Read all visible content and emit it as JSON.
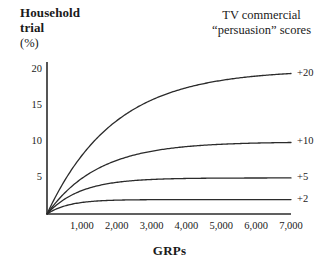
{
  "chart_data": {
    "type": "line",
    "title": "TV commercial “persuasion” scores",
    "title_line1": "TV commercial",
    "title_line2": "“persuasion” scores",
    "xlabel": "GRPs",
    "ylabel": "Household trial (%)",
    "ylabel_line1": "Household",
    "ylabel_line2": "trial",
    "ylabel_unit": "(%)",
    "xlim": [
      0,
      7000
    ],
    "ylim": [
      0,
      21
    ],
    "grid": false,
    "legend_position": "right-of-curve-ends",
    "xticks": [
      1000,
      2000,
      3000,
      4000,
      5000,
      6000,
      7000
    ],
    "xticklabels": [
      "1,000",
      "2,000",
      "3,000",
      "4,000",
      "5,000",
      "6,000",
      "7,000"
    ],
    "yticks": [
      5,
      10,
      15,
      20
    ],
    "yticklabels": [
      "5",
      "10",
      "15",
      "20"
    ],
    "line_color": "#2b2b2b",
    "axis_color": "#2b2b2b",
    "series": [
      {
        "name": "+20",
        "label": "+20",
        "asymptote": 20,
        "decay_k": 0.00052,
        "x": [
          0,
          250,
          500,
          750,
          1000,
          1500,
          2000,
          2500,
          3000,
          3500,
          4000,
          4500,
          5000,
          5500,
          6000,
          6500,
          7000
        ],
        "values": [
          0.0,
          2.4,
          4.6,
          6.5,
          8.1,
          10.8,
          12.9,
          14.5,
          15.8,
          16.8,
          17.5,
          18.1,
          18.5,
          18.9,
          19.1,
          19.3,
          19.5
        ]
      },
      {
        "name": "+10",
        "label": "+10",
        "asymptote": 10,
        "decay_k": 0.00068,
        "x": [
          0,
          250,
          500,
          750,
          1000,
          1500,
          2000,
          2500,
          3000,
          3500,
          4000,
          4500,
          5000,
          5500,
          6000,
          6500,
          7000
        ],
        "values": [
          0.0,
          1.5,
          2.9,
          4.0,
          4.9,
          6.4,
          7.4,
          8.2,
          8.7,
          9.1,
          9.3,
          9.5,
          9.7,
          9.8,
          9.8,
          9.9,
          9.9
        ]
      },
      {
        "name": "+5",
        "label": "+5",
        "asymptote": 5,
        "decay_k": 0.00105,
        "x": [
          0,
          250,
          500,
          750,
          1000,
          1500,
          2000,
          2500,
          3000,
          3500,
          4000,
          4500,
          5000,
          5500,
          6000,
          6500,
          7000
        ],
        "values": [
          0.0,
          1.15,
          2.05,
          2.72,
          3.25,
          3.96,
          4.39,
          4.64,
          4.79,
          4.87,
          4.93,
          4.96,
          4.97,
          4.98,
          4.99,
          4.99,
          5.0
        ]
      },
      {
        "name": "+2",
        "label": "+2",
        "asymptote": 2,
        "decay_k": 0.0016,
        "x": [
          0,
          250,
          500,
          750,
          1000,
          1500,
          2000,
          2500,
          3000,
          3500,
          4000,
          4500,
          5000,
          5500,
          6000,
          6500,
          7000
        ],
        "values": [
          0.0,
          0.66,
          1.1,
          1.4,
          1.6,
          1.82,
          1.92,
          1.96,
          1.98,
          1.99,
          2.0,
          2.0,
          2.0,
          2.0,
          2.0,
          2.0,
          2.0
        ]
      }
    ]
  }
}
